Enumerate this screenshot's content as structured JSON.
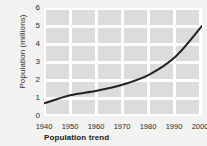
{
  "chart_data": {
    "type": "line",
    "title": "Population trend",
    "xlabel": "",
    "ylabel": "Population (millions)",
    "x": [
      1940,
      1950,
      1960,
      1970,
      1980,
      1990,
      2000
    ],
    "values": [
      0.7,
      1.15,
      1.4,
      1.75,
      2.3,
      3.3,
      5.0
    ],
    "series": [
      {
        "name": "Population",
        "values": [
          0.7,
          1.15,
          1.4,
          1.75,
          2.3,
          3.3,
          5.0
        ]
      }
    ],
    "xlim": [
      1940,
      2000
    ],
    "ylim": [
      0,
      6
    ],
    "xticks": [
      "1940",
      "1950",
      "1960",
      "1970",
      "1980",
      "1990",
      "2000"
    ],
    "yticks": [
      "0",
      "1",
      "2",
      "3",
      "4",
      "5",
      "6"
    ],
    "grid": true,
    "legend": "none",
    "line_color": "#222222",
    "plot_background": "#dcdcdc",
    "grid_color": "#ffffff",
    "figure_background": "#f2f2f0"
  }
}
